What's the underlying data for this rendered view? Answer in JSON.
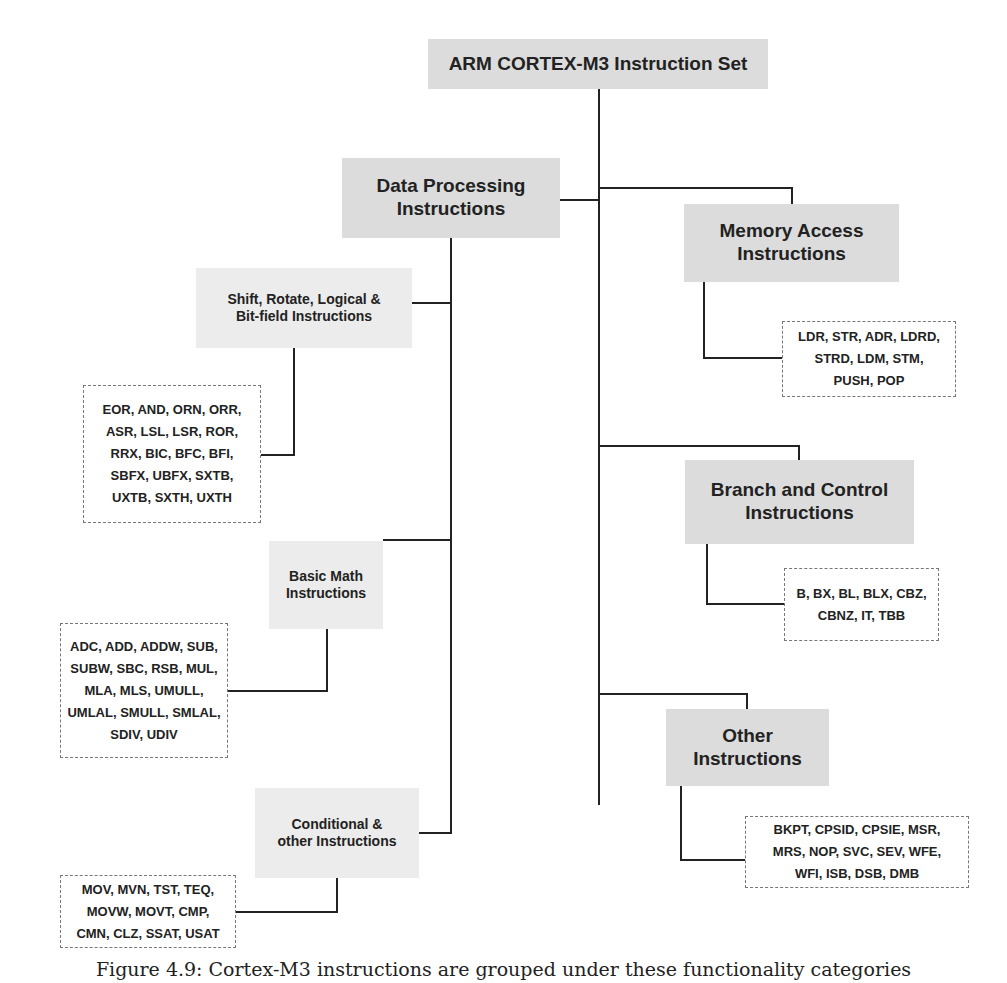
{
  "root": {
    "label": "ARM CORTEX-M3 Instruction Set"
  },
  "data_processing": {
    "label": "Data Processing\nInstructions",
    "children": {
      "shift_rotate": {
        "label": "Shift, Rotate, Logical &\nBit-field Instructions",
        "instructions": "EOR, AND, ORN, ORR,\nASR, LSL, LSR, ROR,\nRRX, BIC, BFC, BFI,\nSBFX, UBFX, SXTB,\nUXTB, SXTH, UXTH"
      },
      "basic_math": {
        "label": "Basic Math\nInstructions",
        "instructions": "ADC, ADD, ADDW, SUB,\nSUBW, SBC, RSB, MUL,\nMLA, MLS, UMULL,\nUMLAL, SMULL, SMLAL,\nSDIV, UDIV"
      },
      "conditional": {
        "label": "Conditional &\nother Instructions",
        "instructions": "MOV, MVN, TST, TEQ,\nMOVW, MOVT, CMP,\nCMN,  CLZ, SSAT, USAT"
      }
    }
  },
  "memory_access": {
    "label": "Memory Access\nInstructions",
    "instructions": "LDR, STR, ADR, LDRD,\nSTRD, LDM, STM,\nPUSH, POP"
  },
  "branch_control": {
    "label": "Branch and Control\nInstructions",
    "instructions": "B, BX, BL, BLX, CBZ,\nCBNZ, IT, TBB"
  },
  "other": {
    "label": "Other\nInstructions",
    "instructions": "BKPT, CPSID, CPSIE, MSR,\nMRS, NOP, SVC, SEV, WFE,\nWFI, ISB, DSB, DMB"
  },
  "caption": "Figure 4.9: Cortex-M3 instructions are grouped under these functionality categories"
}
